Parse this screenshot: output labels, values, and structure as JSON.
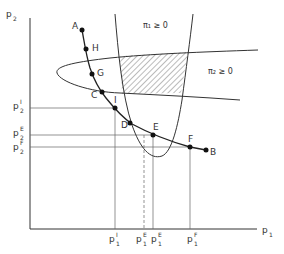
{
  "figure": {
    "x_axis_label": "p",
    "x_axis_label_sub": "1",
    "y_axis_label": "p",
    "y_axis_label_sub": "2",
    "regions": {
      "pi1": "π₁ ≥ 0",
      "pi2": "π₂ ≥ 0"
    },
    "points": [
      {
        "id": "A",
        "label": "A",
        "x": 82,
        "y": 30,
        "lx": 72,
        "ly": 24
      },
      {
        "id": "H",
        "label": "H",
        "x": 86,
        "y": 49,
        "lx": 92,
        "ly": 45
      },
      {
        "id": "G",
        "label": "G",
        "x": 92,
        "y": 74,
        "lx": 97,
        "ly": 70
      },
      {
        "id": "C",
        "label": "C",
        "x": 102,
        "y": 92,
        "lx": 92,
        "ly": 92
      },
      {
        "id": "I",
        "label": "I",
        "x": 115,
        "y": 108,
        "lx": 114,
        "ly": 97
      },
      {
        "id": "D",
        "label": "D",
        "x": 130,
        "y": 123,
        "lx": 122,
        "ly": 122
      },
      {
        "id": "E",
        "label": "E",
        "x": 153,
        "y": 135,
        "lx": 153,
        "ly": 124
      },
      {
        "id": "F",
        "label": "F",
        "x": 190,
        "y": 147,
        "lx": 188,
        "ly": 136
      },
      {
        "id": "B",
        "label": "B",
        "x": 206,
        "y": 150,
        "lx": 210,
        "ly": 149
      }
    ],
    "y_ticks": [
      {
        "base": "p",
        "sup": "I",
        "sub": "2",
        "y": 108
      },
      {
        "base": "p",
        "sup": "E",
        "sub": "2",
        "y": 135
      },
      {
        "base": "p",
        "sup": "F",
        "sub": "2",
        "y": 147
      }
    ],
    "x_ticks": [
      {
        "base": "p",
        "sup": "I",
        "sub": "1",
        "x": 115
      },
      {
        "base": "p",
        "sup": "E",
        "sub": "1",
        "x": 144,
        "dashed": true
      },
      {
        "base": "p",
        "sup": "E",
        "sub": "1",
        "x": 153
      },
      {
        "base": "p",
        "sup": "F",
        "sub": "1",
        "x": 190
      }
    ]
  }
}
